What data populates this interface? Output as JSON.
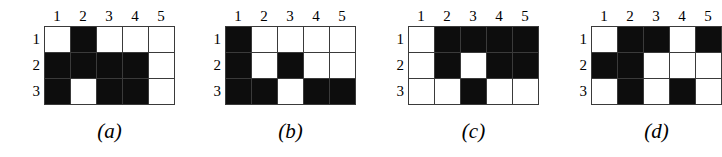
{
  "figure": {
    "colors": {
      "filled": "#0d0d0d",
      "empty": "#ffffff",
      "gridline": "#3a3a3a",
      "background": "#ffffff",
      "text": "#000000"
    },
    "column_headers": [
      "1",
      "2",
      "3",
      "4",
      "5"
    ],
    "row_headers": [
      "1",
      "2",
      "3"
    ],
    "grids": [
      {
        "caption": "(a)",
        "column_headers": [
          "1",
          "2",
          "3",
          "4",
          "5"
        ],
        "row_headers": [
          "1",
          "2",
          "3"
        ],
        "cells": [
          [
            0,
            1,
            0,
            0,
            0
          ],
          [
            1,
            1,
            1,
            1,
            0
          ],
          [
            1,
            0,
            1,
            1,
            0
          ]
        ]
      },
      {
        "caption": "(b)",
        "column_headers": [
          "1",
          "2",
          "3",
          "4",
          "5"
        ],
        "row_headers": [
          "1",
          "2",
          "3"
        ],
        "cells": [
          [
            1,
            0,
            0,
            0,
            0
          ],
          [
            1,
            0,
            1,
            0,
            0
          ],
          [
            1,
            1,
            0,
            1,
            1
          ]
        ]
      },
      {
        "caption": "(c)",
        "column_headers": [
          "1",
          "2",
          "3",
          "4",
          "5"
        ],
        "row_headers": [
          "1",
          "2",
          "3"
        ],
        "cells": [
          [
            0,
            1,
            1,
            1,
            1
          ],
          [
            0,
            1,
            0,
            1,
            1
          ],
          [
            0,
            0,
            1,
            0,
            0
          ]
        ]
      },
      {
        "caption": "(d)",
        "column_headers": [
          "1",
          "2",
          "3",
          "4",
          "5"
        ],
        "row_headers": [
          "1",
          "2",
          "3"
        ],
        "cells": [
          [
            0,
            1,
            1,
            0,
            1
          ],
          [
            1,
            1,
            0,
            0,
            0
          ],
          [
            0,
            1,
            0,
            1,
            0
          ]
        ]
      }
    ]
  }
}
